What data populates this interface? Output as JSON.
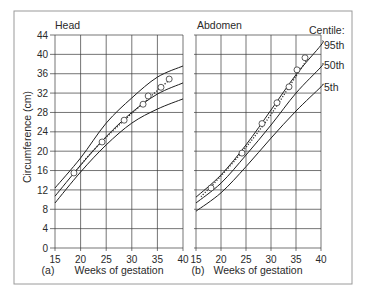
{
  "figure": {
    "ylabel": "Circumference (cm)",
    "panels": [
      {
        "title": "Head",
        "panel_label": "(a)",
        "xlabel": "Weeks of gestation"
      },
      {
        "title": "Abdomen",
        "panel_label": "(b)",
        "xlabel": "Weeks of gestation"
      }
    ],
    "legend": {
      "title": "Centile:",
      "items": [
        "95th",
        "50th",
        "5th"
      ]
    },
    "colors": {
      "lines": "#1e1e1e",
      "grid": "#3a3a3a",
      "frame": "#9a9a9a",
      "background": "#ffffff"
    }
  },
  "chart_data": [
    {
      "type": "line",
      "title": "Head",
      "panel_label": "(a)",
      "xlabel": "Weeks of gestation",
      "ylabel": "Circumference (cm)",
      "xlim": [
        15,
        40
      ],
      "ylim": [
        0,
        44
      ],
      "xticks": [
        15,
        20,
        25,
        30,
        35,
        40
      ],
      "yticks": [
        0,
        4,
        8,
        12,
        16,
        20,
        24,
        28,
        32,
        36,
        40,
        44
      ],
      "show_yticklabels": true,
      "grid": true,
      "series": [
        {
          "name": "95th",
          "x": [
            15,
            20,
            25,
            30,
            35,
            40
          ],
          "y": [
            12.4,
            18.6,
            25.8,
            31.0,
            35.3,
            37.6
          ]
        },
        {
          "name": "50th",
          "x": [
            15,
            20,
            25,
            30,
            35,
            40
          ],
          "y": [
            10.7,
            17.1,
            23.0,
            28.0,
            31.8,
            34.1
          ]
        },
        {
          "name": "5th",
          "x": [
            15,
            20,
            25,
            30,
            35,
            40
          ],
          "y": [
            9.3,
            15.7,
            21.3,
            25.8,
            28.7,
            30.8
          ]
        }
      ],
      "trend": {
        "name": "fitted trend (dotted)",
        "x": [
          18.5,
          22,
          26,
          30,
          34,
          37
        ],
        "y": [
          15.2,
          19.6,
          23.9,
          27.8,
          31.6,
          34.4
        ]
      },
      "observations": {
        "name": "measurements",
        "x": [
          18.7,
          24.2,
          28.5,
          32.2,
          33.2,
          35.7,
          37.3
        ],
        "y": [
          15.5,
          21.9,
          26.4,
          29.7,
          31.4,
          33.2,
          34.9
        ]
      }
    },
    {
      "type": "line",
      "title": "Abdomen",
      "panel_label": "(b)",
      "xlabel": "Weeks of gestation",
      "ylabel": "Circumference (cm)",
      "xlim": [
        15,
        40
      ],
      "ylim": [
        0,
        44
      ],
      "xticks": [
        15,
        20,
        25,
        30,
        35,
        40
      ],
      "yticks": [
        0,
        4,
        8,
        12,
        16,
        20,
        24,
        28,
        32,
        36,
        40,
        44
      ],
      "show_yticklabels": false,
      "grid": true,
      "legend_title": "Centile:",
      "legend_position": "right, at line ends",
      "series": [
        {
          "name": "95th",
          "x": [
            15,
            20,
            25,
            30,
            35,
            40,
            40.3
          ],
          "y": [
            10.5,
            15.1,
            21.3,
            28.5,
            35.8,
            41.9,
            42.8
          ]
        },
        {
          "name": "50th",
          "x": [
            15,
            20,
            25,
            30,
            35,
            40,
            40.3
          ],
          "y": [
            9.3,
            13.4,
            19.2,
            25.4,
            32.0,
            37.4,
            38.1
          ]
        },
        {
          "name": "5th",
          "x": [
            15,
            20,
            25,
            30,
            35,
            40,
            40.3
          ],
          "y": [
            7.6,
            11.4,
            16.8,
            22.7,
            28.3,
            33.3,
            33.8
          ]
        }
      ],
      "trend": {
        "name": "fitted trend (dotted)",
        "x": [
          16,
          20,
          25,
          30,
          35,
          37
        ],
        "y": [
          10.6,
          14.9,
          20.8,
          27.6,
          35.5,
          38.6
        ]
      },
      "observations": {
        "name": "measurements",
        "x": [
          18.0,
          24.2,
          28.2,
          31.2,
          33.6,
          35.2,
          36.8
        ],
        "y": [
          12.4,
          19.6,
          25.7,
          30.0,
          33.3,
          36.8,
          39.3
        ]
      }
    }
  ]
}
